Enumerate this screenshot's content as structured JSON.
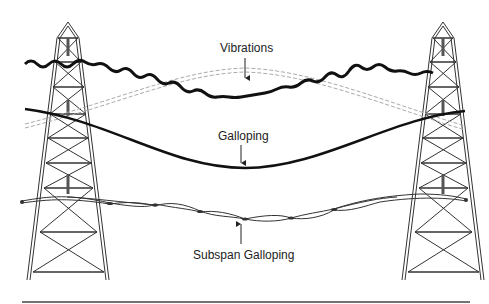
{
  "diagram": {
    "type": "transmission-line-conductor-motion",
    "labels": {
      "vibrations": "Vibrations",
      "galloping": "Galloping",
      "subspan_galloping": "Subspan Galloping"
    },
    "components": [
      "left-tower",
      "right-tower",
      "vibrating-conductor",
      "galloping-conductor",
      "rest-position-conductor",
      "subspan-bundle-conductor",
      "ground-line"
    ],
    "colors": {
      "line": "#111111",
      "tower": "#333333",
      "dashed": "#aaaaaa",
      "background": "#ffffff"
    }
  }
}
